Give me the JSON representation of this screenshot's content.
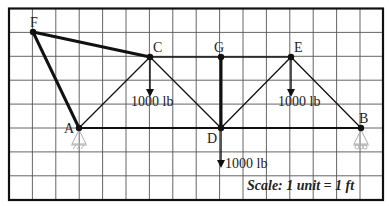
{
  "diagram": {
    "type": "truss",
    "grid": {
      "cols": 16,
      "rows": 8,
      "x0": 9,
      "y0": 8.5,
      "dx": 23.4,
      "dy": 23.9
    },
    "colors": {
      "member": "#111111",
      "grid": "#555555",
      "frame": "#111111",
      "support": "#aaaaaa"
    },
    "nodes": [
      {
        "id": "F",
        "label": "F",
        "x": 33,
        "y": 32,
        "lx": 30,
        "ly": 27
      },
      {
        "id": "C",
        "label": "C",
        "x": 150,
        "y": 57,
        "lx": 153,
        "ly": 52
      },
      {
        "id": "G",
        "label": "G",
        "x": 221,
        "y": 57,
        "lx": 214,
        "ly": 52
      },
      {
        "id": "E",
        "label": "E",
        "x": 291,
        "y": 57,
        "lx": 294,
        "ly": 52
      },
      {
        "id": "A",
        "label": "A",
        "x": 79,
        "y": 128,
        "lx": 64,
        "ly": 133
      },
      {
        "id": "D",
        "label": "D",
        "x": 221,
        "y": 128,
        "lx": 207,
        "ly": 143
      },
      {
        "id": "B",
        "label": "B",
        "x": 361,
        "y": 128,
        "lx": 359,
        "ly": 123
      }
    ],
    "members": [
      {
        "from": "F",
        "to": "C",
        "weight": "thick"
      },
      {
        "from": "F",
        "to": "A",
        "weight": "thick"
      },
      {
        "from": "C",
        "to": "G",
        "weight": "thin"
      },
      {
        "from": "G",
        "to": "E",
        "weight": "thin"
      },
      {
        "from": "A",
        "to": "C",
        "weight": "thin"
      },
      {
        "from": "C",
        "to": "D",
        "weight": "thin"
      },
      {
        "from": "G",
        "to": "D",
        "weight": "thick"
      },
      {
        "from": "D",
        "to": "E",
        "weight": "thin"
      },
      {
        "from": "E",
        "to": "B",
        "weight": "thin"
      },
      {
        "from": "A",
        "to": "D",
        "weight": "medium"
      },
      {
        "from": "D",
        "to": "B",
        "weight": "medium"
      }
    ],
    "loads": [
      {
        "node": "C",
        "label": "1000 lb",
        "x1": 150,
        "y1": 57,
        "y2": 97,
        "tx": 131,
        "ty": 106
      },
      {
        "node": "E",
        "label": "1000 lb",
        "x1": 291,
        "y1": 57,
        "y2": 97,
        "tx": 278,
        "ty": 106
      },
      {
        "node": "D",
        "label": "1000 lb",
        "x1": 221,
        "y1": 128,
        "y2": 168,
        "tx": 225,
        "ty": 168
      }
    ],
    "supports": [
      {
        "node": "A",
        "type": "pin"
      },
      {
        "node": "B",
        "type": "roller"
      }
    ],
    "scale_text": "Scale: 1 unit = 1 ft"
  }
}
